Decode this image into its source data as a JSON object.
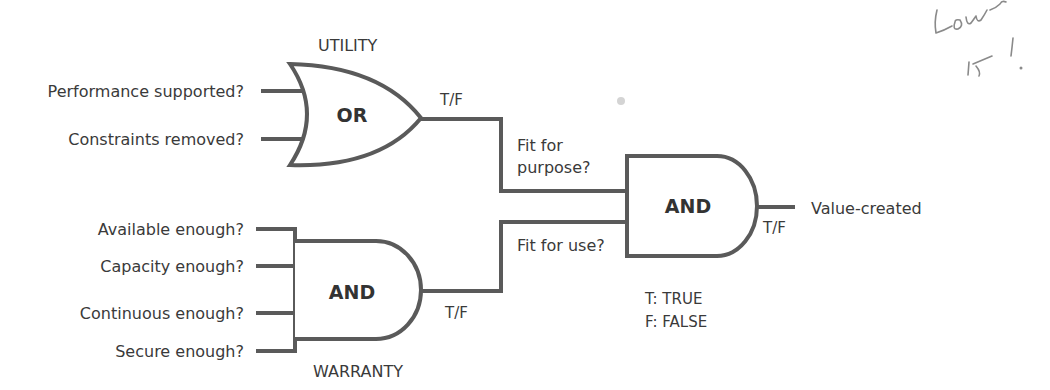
{
  "diagram": {
    "utility_gate": {
      "title": "UTILITY",
      "type": "OR",
      "inputs": [
        "Performance supported?",
        "Constraints removed?"
      ],
      "output_label": "T/F"
    },
    "warranty_gate": {
      "title": "WARRANTY",
      "type": "AND",
      "inputs": [
        "Available enough?",
        "Capacity enough?",
        "Continuous enough?",
        "Secure enough?"
      ],
      "output_label": "T/F"
    },
    "final_gate": {
      "type": "AND",
      "inputs": [
        "Fit for",
        "purpose?",
        "Fit for use?"
      ],
      "output_label": "T/F",
      "output": "Value-created"
    },
    "legend": [
      "T: TRUE",
      "F: FALSE"
    ],
    "handwriting": [
      "Love",
      "it!"
    ],
    "colors": {
      "line": "#5a5a5a",
      "text": "#3a3a3a",
      "background": "#ffffff"
    }
  }
}
